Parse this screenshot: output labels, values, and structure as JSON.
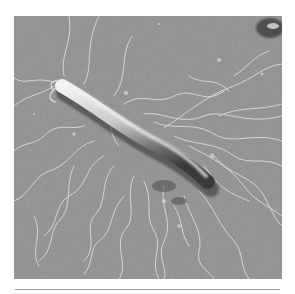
{
  "image": {
    "subject": "electron micrograph of a rod-shaped bacterium with numerous flagella",
    "style": "grayscale",
    "colors": {
      "page_background": "#ffffff",
      "substrate": "#8c8c8c",
      "cell_highlight": "#eeeeee",
      "cell_shadow": "#3a3a3a",
      "flagella": "#d8d8d8",
      "rule": "#9a9a9a"
    }
  }
}
